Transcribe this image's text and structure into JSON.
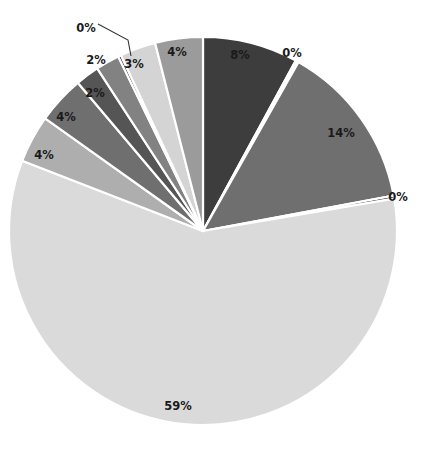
{
  "chart_data": {
    "type": "pie",
    "title": "",
    "subtitle": "",
    "xlabel": "",
    "ylabel": "",
    "legend_position": "none",
    "grid": false,
    "label_format": "percent",
    "start_angle_deg": 0,
    "direction": "clockwise",
    "center": {
      "x": 203,
      "y": 231
    },
    "radius": 194,
    "slice_gap_color": "#ffffff",
    "categories": [
      "Slice 1",
      "Slice 2",
      "Slice 3",
      "Slice 4",
      "Slice 5",
      "Slice 6",
      "Slice 7",
      "Slice 8",
      "Slice 9",
      "Slice 10",
      "Slice 11",
      "Slice 12"
    ],
    "values": [
      8,
      0,
      14,
      0,
      59,
      4,
      4,
      2,
      2,
      0,
      3,
      4
    ],
    "labels": [
      "8%",
      "0%",
      "14%",
      "0%",
      "59%",
      "4%",
      "4%",
      "2%",
      "2%",
      "0%",
      "3%",
      "4%"
    ],
    "colors": [
      "#3d3d3d",
      "#ffffff",
      "#6f6f6f",
      "#111111",
      "#dadada",
      "#aeaeae",
      "#6f6f6f",
      "#555555",
      "#828282",
      "#111111",
      "#d4d4d4",
      "#9b9b9b"
    ],
    "slices": [
      {
        "label": "8%",
        "value": 8,
        "color": "#3d3d3d",
        "label_pos": {
          "x": 240,
          "y": 55
        },
        "leader": false
      },
      {
        "label": "0%",
        "value": 0,
        "color": "#ffffff",
        "label_pos": {
          "x": 292,
          "y": 53
        },
        "leader": false
      },
      {
        "label": "14%",
        "value": 14,
        "color": "#6f6f6f",
        "label_pos": {
          "x": 341,
          "y": 133
        },
        "leader": false
      },
      {
        "label": "0%",
        "value": 0,
        "color": "#111111",
        "label_pos": {
          "x": 398,
          "y": 197
        },
        "leader": false
      },
      {
        "label": "59%",
        "value": 59,
        "color": "#dadada",
        "label_pos": {
          "x": 178,
          "y": 406
        },
        "leader": false
      },
      {
        "label": "4%",
        "value": 4,
        "color": "#aeaeae",
        "label_pos": {
          "x": 44,
          "y": 155
        },
        "leader": false
      },
      {
        "label": "4%",
        "value": 4,
        "color": "#6f6f6f",
        "label_pos": {
          "x": 66,
          "y": 117
        },
        "leader": false
      },
      {
        "label": "2%",
        "value": 2,
        "color": "#555555",
        "label_pos": {
          "x": 95,
          "y": 93
        },
        "leader": false
      },
      {
        "label": "2%",
        "value": 2,
        "color": "#828282",
        "label_pos": {
          "x": 96,
          "y": 60
        },
        "leader": false
      },
      {
        "label": "0%",
        "value": 0,
        "color": "#111111",
        "label_pos": {
          "x": 86,
          "y": 28
        },
        "leader": true
      },
      {
        "label": "3%",
        "value": 3,
        "color": "#d4d4d4",
        "label_pos": {
          "x": 134,
          "y": 64
        },
        "leader": false
      },
      {
        "label": "4%",
        "value": 4,
        "color": "#9b9b9b",
        "label_pos": {
          "x": 177,
          "y": 52
        },
        "leader": false
      }
    ],
    "leader_lines": [
      {
        "for_label": "0%",
        "points": "98,24 128,40 131,56"
      }
    ]
  }
}
